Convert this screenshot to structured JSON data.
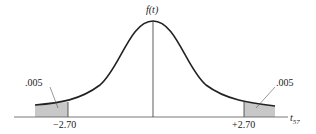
{
  "diagram": {
    "type": "t-distribution two-tailed",
    "y_label": "f(t)",
    "x_label": "t",
    "x_label_subscript": "57",
    "left_critical": "−2.70",
    "right_critical": "+2.70",
    "left_tail_area": ".005",
    "right_tail_area": ".005",
    "colors": {
      "curve": "#222222",
      "shade": "#c8c8c8",
      "axis": "#555555"
    }
  }
}
